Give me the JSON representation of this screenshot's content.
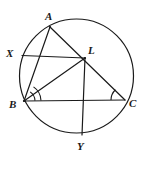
{
  "figure": {
    "canvas": {
      "width": 147,
      "height": 171,
      "background": "#ffffff"
    },
    "stroke_color": "#1a1a1a",
    "label_color": "#1a1a1a"
  },
  "circle": {
    "name": "circumscribed-circle",
    "cx": 76.5,
    "cy": 76.0,
    "r": 57.0,
    "stroke_width": 1.2
  },
  "points": [
    {
      "id": "A",
      "label": "A",
      "x": 50.0,
      "y": 27.0,
      "label_x": 45.0,
      "label_y": 11.0,
      "on_circle": true
    },
    {
      "id": "X",
      "label": "X",
      "x": 22.0,
      "y": 55.5,
      "label_x": 6.0,
      "label_y": 48.0,
      "on_circle": true
    },
    {
      "id": "L",
      "label": "L",
      "x": 85.0,
      "y": 58.0,
      "label_x": 88.0,
      "label_y": 45.0,
      "on_circle": false
    },
    {
      "id": "B",
      "label": "B",
      "x": 24.0,
      "y": 101.0,
      "label_x": 9.0,
      "label_y": 99.0,
      "on_circle": true
    },
    {
      "id": "C",
      "label": "C",
      "x": 125.0,
      "y": 100.0,
      "label_x": 129.0,
      "label_y": 98.0,
      "on_circle": true
    },
    {
      "id": "Y",
      "label": "Y",
      "x": 82.0,
      "y": 135.0,
      "label_x": 77.0,
      "label_y": 141.0,
      "on_circle": true
    }
  ],
  "segments": [
    {
      "id": "A-B",
      "from": "A",
      "to": "B",
      "name": "segment-ab"
    },
    {
      "id": "A-C",
      "from": "A",
      "to": "C",
      "name": "segment-ac-through-l"
    },
    {
      "id": "B-L",
      "from": "B",
      "to": "L",
      "name": "segment-bl"
    },
    {
      "id": "B-C",
      "from": "B",
      "to": "C",
      "name": "segment-bc"
    },
    {
      "id": "X-L",
      "from": "X",
      "to": "L",
      "name": "segment-xl"
    },
    {
      "id": "L-Y",
      "from": "L",
      "to": "Y",
      "name": "segment-ly"
    }
  ],
  "angle_marks": [
    {
      "id": "B-outer",
      "vertex": "B",
      "radius": 17,
      "start_deg": -56,
      "end_deg": -2,
      "name": "angle-arc-b-outer"
    },
    {
      "id": "B-inner",
      "vertex": "B",
      "radius": 11,
      "start_deg": -56,
      "end_deg": -2,
      "name": "angle-arc-b-inner"
    },
    {
      "id": "C-single",
      "vertex": "C",
      "radius": 14,
      "start_deg": 180,
      "end_deg": 227,
      "name": "angle-arc-c"
    }
  ]
}
